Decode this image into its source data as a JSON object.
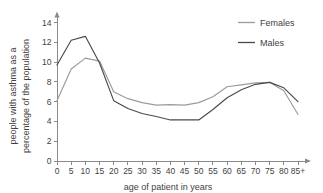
{
  "chart_data": {
    "type": "line",
    "title": "",
    "xlabel": "age of patient in years",
    "ylabel_line1": "people with asthma as a",
    "ylabel_line2": "percentage of the population",
    "x": [
      0,
      5,
      10,
      15,
      20,
      25,
      30,
      35,
      40,
      45,
      50,
      55,
      60,
      65,
      70,
      75,
      80,
      85
    ],
    "categories": [
      "0",
      "5",
      "10",
      "15",
      "20",
      "25",
      "30",
      "35",
      "40",
      "45",
      "50",
      "55",
      "60",
      "65",
      "70",
      "75",
      "80",
      "85+"
    ],
    "yticks": [
      0,
      2,
      4,
      6,
      8,
      10,
      12,
      14
    ],
    "ytick_labels": [
      "0",
      "2",
      "4",
      "6",
      "8",
      "10",
      "12",
      "14"
    ],
    "xlim": [
      0,
      85
    ],
    "ylim": [
      0,
      14
    ],
    "grid": false,
    "legend_position": "top-right",
    "series": [
      {
        "name": "Females",
        "color": "#9b9b9b",
        "values": [
          6.1,
          9.3,
          10.4,
          10.1,
          7.0,
          6.3,
          5.9,
          5.65,
          5.7,
          5.65,
          5.9,
          6.5,
          7.5,
          7.7,
          7.9,
          7.95,
          7.1,
          4.7
        ]
      },
      {
        "name": "Males",
        "color": "#4a4a4a",
        "values": [
          9.7,
          12.2,
          12.6,
          9.9,
          6.1,
          5.3,
          4.8,
          4.5,
          4.15,
          4.15,
          4.15,
          5.2,
          6.4,
          7.2,
          7.75,
          7.95,
          7.4,
          6.0
        ]
      }
    ]
  },
  "legend": {
    "items": [
      {
        "label": "Females"
      },
      {
        "label": "Males"
      }
    ]
  },
  "axes": {
    "x_title": "age of patient in years",
    "y_title_line1": "people with asthma as a",
    "y_title_line2": "percentage of the population"
  }
}
